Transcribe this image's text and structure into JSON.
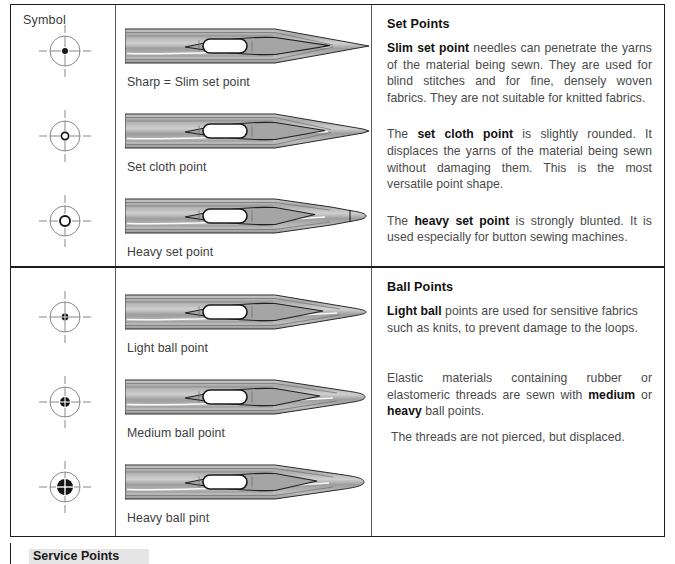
{
  "table": {
    "symbol_header": "Symbol"
  },
  "sections": [
    {
      "id": "set-points",
      "heading": "Set Points",
      "rows": [
        {
          "caption": "Sharp = Slim set point",
          "symbol": "crosshair-solid-dot-small",
          "needle": "sharp-taper-point"
        },
        {
          "caption": "Set cloth point",
          "symbol": "crosshair-ring-small",
          "needle": "set-cloth-point"
        },
        {
          "caption": "Heavy set point",
          "symbol": "crosshair-ring-medium",
          "needle": "heavy-blunt-point"
        }
      ],
      "paragraphs": [
        {
          "lead": "Slim set point",
          "rest": " needles can penetrate the yarns of the material being sewn. They are used for blind stitches and for fine, densely woven fabrics. They are not suitable for knitted fabrics."
        },
        {
          "pre": "The ",
          "lead": "set cloth point",
          "rest": " is slightly rounded. It displaces the yarns of the material being sewn without damaging them. This is the most versatile point shape."
        },
        {
          "pre": "The ",
          "lead": "heavy set point",
          "rest": " is strongly blunted. It is used especially for button sewing machines."
        }
      ]
    },
    {
      "id": "ball-points",
      "heading": "Ball Points",
      "rows": [
        {
          "caption": "Light ball point",
          "symbol": "crosshair-ball-small",
          "needle": "light-ball-point"
        },
        {
          "caption": "Medium ball point",
          "symbol": "crosshair-ball-medium",
          "needle": "medium-ball-point"
        },
        {
          "caption": "Heavy ball pint",
          "symbol": "crosshair-ball-large",
          "needle": "heavy-ball-point"
        }
      ],
      "paragraphs": [
        {
          "lead": "Light ball",
          "rest": " points are used for sensitive fabrics such as knits, to prevent damage to the loops."
        },
        {
          "pre": "Elastic materials containing rubber or elastomeric threads are sewn with ",
          "lead": "medium",
          "mid": " or ",
          "lead2": "heavy",
          "rest": " ball points."
        },
        {
          "plain": "The threads are not pierced, but displaced."
        }
      ]
    }
  ],
  "footer": {
    "cutoff_heading": "Service Points"
  },
  "colors": {
    "border": "#1d1d1d",
    "grid": "#5a5a5a",
    "needle_light": "#d8d8d8",
    "needle_mid": "#b4b4b4",
    "needle_dark": "#8e8e8e",
    "text": "#4a4a4a",
    "heading": "#111111"
  }
}
